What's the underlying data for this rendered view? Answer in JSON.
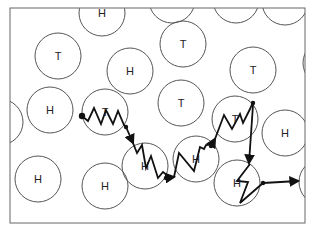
{
  "diagram": {
    "type": "molecular-path-schematic",
    "frame": {
      "x": 10,
      "y": 8,
      "width": 295,
      "height": 215
    },
    "stroke_color": "#555555",
    "path_color": "#111111",
    "circle_radius": 23,
    "circles": [
      {
        "id": "c1",
        "label": "H",
        "cx": 102,
        "cy": 13
      },
      {
        "id": "c2",
        "label": "T",
        "cx": 58,
        "cy": 56
      },
      {
        "id": "c3",
        "label": "T",
        "cx": 183,
        "cy": 44
      },
      {
        "id": "c4",
        "label": "H",
        "cx": 130,
        "cy": 71
      },
      {
        "id": "c5",
        "label": "T",
        "cx": 253,
        "cy": 70
      },
      {
        "id": "c6",
        "label": "H",
        "cx": 50,
        "cy": 110
      },
      {
        "id": "c7",
        "label": "T",
        "cx": 181,
        "cy": 103
      },
      {
        "id": "c8",
        "label": "T",
        "cx": 105,
        "cy": 112
      },
      {
        "id": "c9",
        "label": "T",
        "cx": 235,
        "cy": 119
      },
      {
        "id": "c10",
        "label": "H",
        "cx": 145,
        "cy": 166
      },
      {
        "id": "c11",
        "label": "H",
        "cx": 196,
        "cy": 159
      },
      {
        "id": "c12",
        "label": "H",
        "cx": 285,
        "cy": 133
      },
      {
        "id": "c13",
        "label": "H",
        "cx": 38,
        "cy": 179
      },
      {
        "id": "c14",
        "label": "H",
        "cx": 105,
        "cy": 186
      },
      {
        "id": "c15",
        "label": "H",
        "cx": 237,
        "cy": 183
      }
    ],
    "partial_circles": [
      {
        "id": "p1",
        "cx": 0,
        "cy": 122
      },
      {
        "id": "p2",
        "cx": 172,
        "cy": 0
      },
      {
        "id": "p3",
        "cx": 236,
        "cy": 0
      },
      {
        "id": "p4",
        "cx": 285,
        "cy": 2
      },
      {
        "id": "p5",
        "cx": 326,
        "cy": 63
      },
      {
        "id": "p6",
        "cx": 322,
        "cy": 182
      }
    ],
    "path": {
      "description": "Zig-zag walk through T and H circles ending with arrow exiting right",
      "nodes": [
        {
          "x": 82,
          "y": 116
        },
        {
          "x": 126,
          "y": 127
        },
        {
          "x": 172,
          "y": 178
        },
        {
          "x": 214,
          "y": 144
        },
        {
          "x": 253,
          "y": 102
        },
        {
          "x": 262,
          "y": 183
        }
      ],
      "end_arrow": {
        "x": 300,
        "y": 181
      }
    }
  }
}
